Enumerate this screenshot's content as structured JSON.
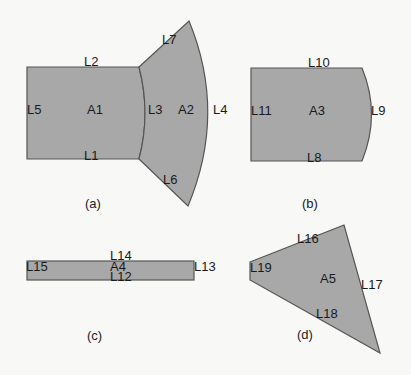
{
  "figure": {
    "panels": [
      {
        "caption": "(a)",
        "areas": [
          "A1",
          "A2"
        ],
        "lines": [
          "L1",
          "L2",
          "L3",
          "L4",
          "L5",
          "L6",
          "L7"
        ]
      },
      {
        "caption": "(b)",
        "areas": [
          "A3"
        ],
        "lines": [
          "L8",
          "L9",
          "L10",
          "L11"
        ]
      },
      {
        "caption": "(c)",
        "areas": [
          "A4"
        ],
        "lines": [
          "L12",
          "L13",
          "L14",
          "L15"
        ]
      },
      {
        "caption": "(d)",
        "areas": [
          "A5"
        ],
        "lines": [
          "L16",
          "L17",
          "L18",
          "L19"
        ]
      }
    ]
  },
  "labels": {
    "a": {
      "A1": "A1",
      "A2": "A2",
      "L1": "L1",
      "L2": "L2",
      "L3": "L3",
      "L4": "L4",
      "L5": "L5",
      "L6": "L6",
      "L7": "L7",
      "caption": "(a)"
    },
    "b": {
      "A3": "A3",
      "L8": "L8",
      "L9": "L9",
      "L10": "L10",
      "L11": "L11",
      "caption": "(b)"
    },
    "c": {
      "A4": "A4",
      "L12": "L12",
      "L13": "L13",
      "L14": "L14",
      "L15": "L15",
      "caption": "(c)"
    },
    "d": {
      "A5": "A5",
      "L16": "L16",
      "L17": "L17",
      "L18": "L18",
      "L19": "L19",
      "caption": "(d)"
    }
  },
  "colors": {
    "fill": "#a8a8a8",
    "stroke": "#555555",
    "background": "#f8f8f6"
  }
}
